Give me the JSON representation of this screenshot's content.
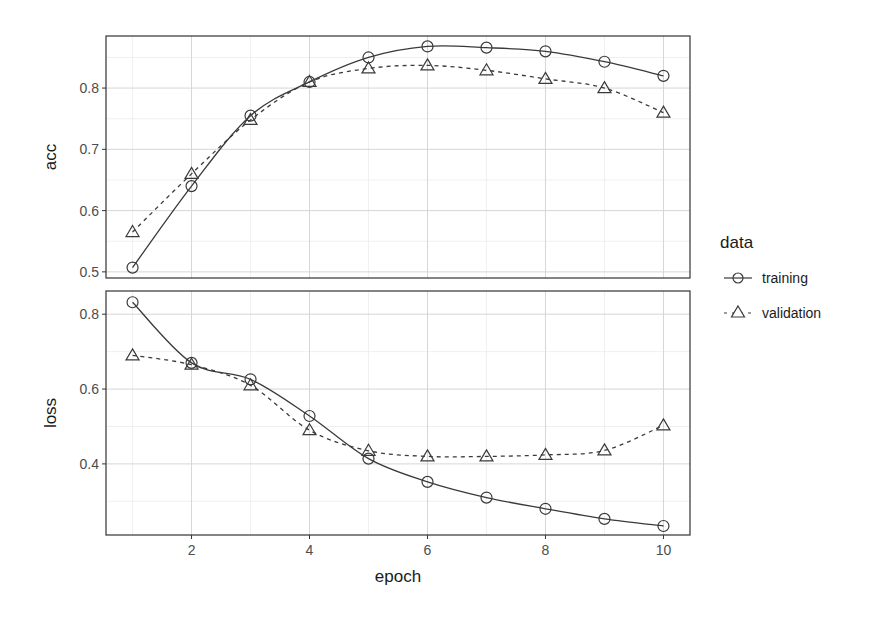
{
  "chart_data": {
    "type": "line",
    "title": "",
    "xlabel": "epoch",
    "x": [
      1,
      2,
      3,
      4,
      5,
      6,
      7,
      8,
      9,
      10
    ],
    "x_ticks": [
      2,
      4,
      6,
      8,
      10
    ],
    "xlim": [
      0.55,
      10.45
    ],
    "grid": true,
    "legend": {
      "title": "data",
      "position": "right",
      "entries": [
        {
          "label": "training",
          "marker": "circle",
          "linestyle": "solid"
        },
        {
          "label": "validation",
          "marker": "triangle",
          "linestyle": "dashed"
        }
      ]
    },
    "panels": [
      {
        "name": "acc",
        "ylabel": "acc",
        "ylim": [
          0.49,
          0.885
        ],
        "y_ticks": [
          0.5,
          0.6,
          0.7,
          0.8
        ],
        "y_tick_labels": [
          "0.5",
          "0.6",
          "0.7",
          "0.8"
        ],
        "series": [
          {
            "name": "training",
            "values": [
              0.507,
              0.64,
              0.755,
              0.81,
              0.85,
              0.868,
              0.866,
              0.86,
              0.843,
              0.82
            ]
          },
          {
            "name": "validation",
            "values": [
              0.565,
              0.66,
              0.748,
              0.81,
              0.832,
              0.837,
              0.829,
              0.815,
              0.8,
              0.76
            ]
          }
        ]
      },
      {
        "name": "loss",
        "ylabel": "loss",
        "ylim": [
          0.21,
          0.862
        ],
        "y_ticks": [
          0.4,
          0.6,
          0.8
        ],
        "y_tick_labels": [
          "0.4",
          "0.6",
          "0.8"
        ],
        "series": [
          {
            "name": "training",
            "values": [
              0.832,
              0.67,
              0.626,
              0.528,
              0.414,
              0.352,
              0.31,
              0.28,
              0.253,
              0.234
            ]
          },
          {
            "name": "validation",
            "values": [
              0.69,
              0.665,
              0.61,
              0.49,
              0.435,
              0.42,
              0.42,
              0.424,
              0.436,
              0.503
            ]
          }
        ]
      }
    ]
  },
  "colors": {
    "line": "#3a3a3a",
    "panel_border": "#333333",
    "grid_major": "#d6d6d6",
    "grid_minor": "#ececec",
    "background": "#ffffff"
  },
  "legend_title": "data",
  "legend_labels": [
    "training",
    "validation"
  ]
}
